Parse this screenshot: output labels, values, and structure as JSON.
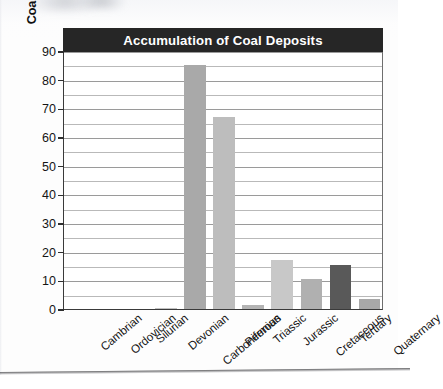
{
  "chart_data": {
    "type": "bar",
    "title": "Accumulation of Coal Deposits",
    "xlabel": "",
    "ylabel": "Coal deposits (tons per year)",
    "categories": [
      "Cambrian",
      "Ordovician",
      "Silurian",
      "Devonian",
      "Carboniferous",
      "Permian",
      "Triassic",
      "Jurassic",
      "Cretaceous",
      "Tertiary",
      "Quaternary"
    ],
    "values": [
      0,
      0,
      0,
      0.5,
      85,
      67,
      1.5,
      17,
      10.5,
      15.5,
      3.5
    ],
    "bar_colors": [
      "#c9c9c9",
      "#c9c9c9",
      "#c9c9c9",
      "#c2c2c2",
      "#a9a9a9",
      "#bdbdbd",
      "#b4b4b4",
      "#c8c8c8",
      "#b0b0b0",
      "#595959",
      "#a8a8a8"
    ],
    "ylim": [
      0,
      90
    ],
    "ytick_labels": [
      "0",
      "10",
      "20",
      "30",
      "40",
      "50",
      "60",
      "70",
      "80",
      "90"
    ],
    "ytick_values": [
      0,
      10,
      20,
      30,
      40,
      50,
      60,
      70,
      80,
      90
    ],
    "minor_gridline_values": [
      5,
      15,
      25,
      35,
      45,
      55,
      65,
      75,
      85
    ],
    "grid": true,
    "legend": "none",
    "title_banner_color": "#262626",
    "title_text_color": "#ffffff",
    "gridline_color": "#9a9a9a",
    "axis_color": "#3a3a3a"
  }
}
